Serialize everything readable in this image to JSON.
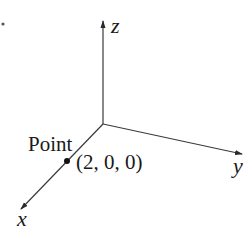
{
  "diagram": {
    "type": "3d-coordinate-axes",
    "axes": {
      "x": {
        "label": "x"
      },
      "y": {
        "label": "y"
      },
      "z": {
        "label": "z"
      }
    },
    "point": {
      "caption": "Point",
      "coordinates": "(2, 0, 0)"
    },
    "colors": {
      "line": "#3a3a3a",
      "text": "#1a1a1a",
      "background": "#ffffff"
    }
  }
}
